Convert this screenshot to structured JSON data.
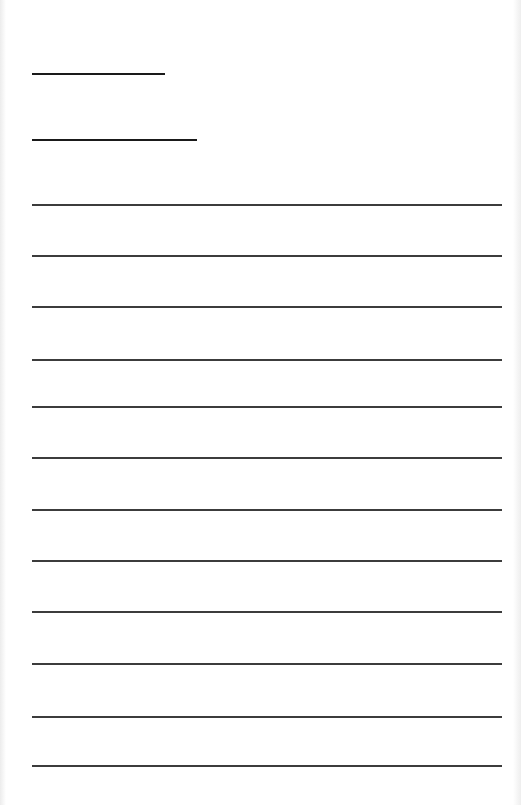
{
  "page": {
    "background": "#ffffff",
    "line_color": "#2a2a2a"
  },
  "header_lines": [
    {
      "x": 32,
      "y": 73,
      "width": 133
    },
    {
      "x": 32,
      "y": 139,
      "width": 165
    }
  ],
  "writing_lines": {
    "x": 32,
    "width": 470,
    "ys": [
      204,
      255,
      306,
      359,
      406,
      457,
      509,
      560,
      611,
      663,
      716,
      765
    ]
  }
}
